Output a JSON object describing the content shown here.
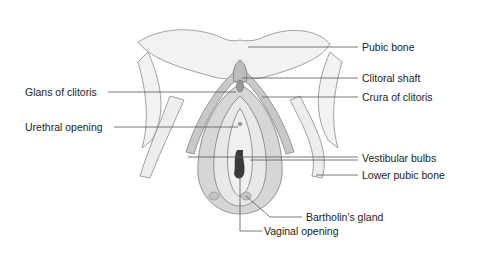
{
  "diagram": {
    "type": "anatomical-illustration",
    "style": "grayscale textbook line drawing",
    "labels": [
      {
        "id": "pubic-bone",
        "text": "Pubic bone",
        "side": "right",
        "x": 362,
        "y": 42
      },
      {
        "id": "clitoral-shaft",
        "text": "Clitoral shaft",
        "side": "right",
        "x": 362,
        "y": 73
      },
      {
        "id": "glans-of-clitoris",
        "text": "Glans of clitoris",
        "side": "left",
        "x": 25,
        "y": 86
      },
      {
        "id": "crura-of-clitoris",
        "text": "Crura of clitoris",
        "side": "right",
        "x": 362,
        "y": 91
      },
      {
        "id": "urethral-opening",
        "text": "Urethral opening",
        "side": "left",
        "x": 25,
        "y": 121
      },
      {
        "id": "vestibular-bulbs",
        "text": "Vestibular bulbs",
        "side": "right",
        "x": 362,
        "y": 153
      },
      {
        "id": "lower-pubic-bone",
        "text": "Lower pubic bone",
        "side": "right",
        "x": 362,
        "y": 170
      },
      {
        "id": "bartholins-gland",
        "text": "Bartholin's gland",
        "side": "right",
        "x": 306,
        "y": 211
      },
      {
        "id": "vaginal-opening",
        "text": "Vaginal opening",
        "side": "right",
        "x": 264,
        "y": 225
      }
    ],
    "colors": {
      "line": "#555555",
      "text": "#222222",
      "tissue_light": "#e6e6e6",
      "tissue_mid": "#b8b8b8",
      "tissue_dark": "#7a7a7a",
      "bone": "#f2f2f2"
    }
  }
}
